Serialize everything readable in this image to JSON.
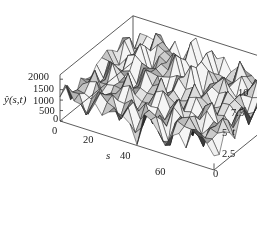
{
  "chart_data": {
    "type": "surface3d",
    "title": "",
    "xlabel": "s",
    "ylabel": "t",
    "zlabel": "ŷ(s,t)",
    "x_ticks": [
      "20",
      "40",
      "60"
    ],
    "x_range": [
      0,
      70
    ],
    "y_ticks": [
      "0",
      "2.5",
      "5",
      "7.5",
      "10"
    ],
    "y_range": [
      0,
      11
    ],
    "z_ticks": [
      "0",
      "500",
      "1000",
      "1500",
      "2000"
    ],
    "z_range": [
      0,
      2000
    ],
    "origin_labels": [
      "0",
      "0"
    ],
    "grid": false,
    "box": true,
    "shading": "grayscale faceted"
  },
  "axes": {
    "z_label": "ŷ(s,t)",
    "z_ticks": [
      {
        "label": "2000",
        "x": 28,
        "y": 72
      },
      {
        "label": "1500",
        "x": 33,
        "y": 84
      },
      {
        "label": "1000",
        "x": 33,
        "y": 96
      },
      {
        "label": "500",
        "x": 39,
        "y": 106
      },
      {
        "label": "0",
        "x": 53,
        "y": 114
      }
    ],
    "origin_zero": {
      "label": "0",
      "x": 52,
      "y": 126
    },
    "s_label": "s",
    "s_ticks": [
      {
        "label": "20",
        "x": 83,
        "y": 135
      },
      {
        "label": "40",
        "x": 120,
        "y": 151
      },
      {
        "label": "60",
        "x": 155,
        "y": 167
      }
    ],
    "t_label": "t",
    "t_ticks": [
      {
        "label": "0",
        "x": 213,
        "y": 169
      },
      {
        "label": "2.5",
        "x": 222,
        "y": 149
      },
      {
        "label": "5",
        "x": 222,
        "y": 128
      },
      {
        "label": "7.5",
        "x": 231,
        "y": 108
      },
      {
        "label": "10",
        "x": 238,
        "y": 88
      }
    ]
  }
}
